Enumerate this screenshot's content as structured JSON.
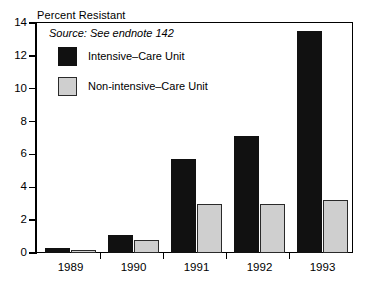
{
  "chart_data": {
    "type": "bar",
    "title": "Percent Resistant",
    "xlabel": "",
    "ylabel": "Percent Resistant",
    "categories": [
      "1989",
      "1990",
      "1991",
      "1992",
      "1993"
    ],
    "series": [
      {
        "name": "Intensive-Care Unit",
        "values": [
          0.3,
          1.1,
          5.7,
          7.1,
          13.5
        ],
        "color": "#111111"
      },
      {
        "name": "Non-intensive-Care Unit",
        "values": [
          0.2,
          0.8,
          3.0,
          3.0,
          3.2
        ],
        "color": "#cfcfcf"
      }
    ],
    "ylim": [
      0,
      14
    ],
    "yticks": [
      0,
      2,
      4,
      6,
      8,
      10,
      12,
      14
    ],
    "ytick_labels": [
      "0",
      "2",
      "4",
      "6",
      "8",
      "10",
      "12",
      "14"
    ],
    "grid": false,
    "legend_position": "top-left",
    "annotations": [
      "Source: See endnote 142"
    ]
  },
  "axis": {
    "y_title": "Percent Resistant"
  },
  "source": {
    "note": "Source: See endnote 142"
  },
  "legend": {
    "entries": [
      {
        "label": "Intensive–Care Unit",
        "swatch": "icu"
      },
      {
        "label": "Non-intensive–Care Unit",
        "swatch": "nonicu"
      }
    ]
  }
}
